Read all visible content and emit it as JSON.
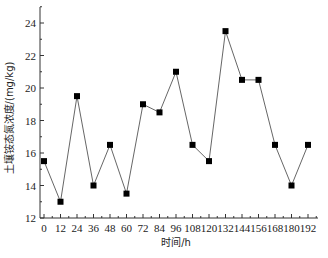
{
  "chart_data": {
    "type": "line",
    "title": "",
    "xlabel": "时间/h",
    "ylabel": "土壤铵态氮浓度/(mg/kg)",
    "x": [
      0,
      12,
      24,
      36,
      48,
      60,
      72,
      84,
      96,
      108,
      120,
      132,
      144,
      156,
      168,
      180,
      192
    ],
    "series": [
      {
        "name": "土壤铵态氮浓度",
        "marker": "square",
        "color": "#000000",
        "line_color": "#555555",
        "values": [
          15.5,
          13.0,
          19.5,
          14.0,
          16.5,
          13.5,
          19.0,
          18.5,
          21.0,
          16.5,
          15.5,
          23.5,
          20.5,
          20.5,
          16.5,
          14.0,
          16.5
        ]
      }
    ],
    "xticks": [
      0,
      12,
      24,
      36,
      48,
      60,
      72,
      84,
      96,
      108,
      120,
      132,
      144,
      156,
      168,
      180,
      192
    ],
    "yticks": [
      12,
      14,
      16,
      18,
      20,
      22,
      24
    ],
    "xlim": [
      0,
      192
    ],
    "ylim": [
      12,
      25
    ],
    "grid": false,
    "legend": null
  }
}
